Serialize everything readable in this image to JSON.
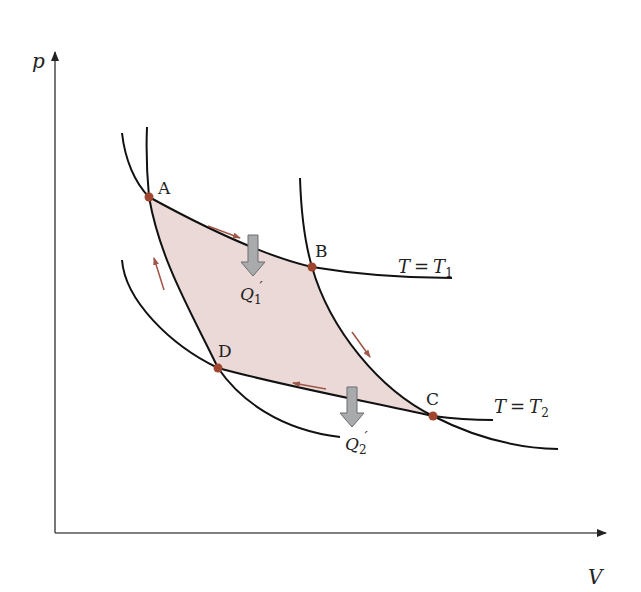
{
  "diagram": {
    "axes": {
      "y_label": "p",
      "x_label": "V"
    },
    "points": [
      {
        "label": "A",
        "x": 149,
        "y": 197
      },
      {
        "label": "B",
        "x": 312,
        "y": 267
      },
      {
        "label": "C",
        "x": 433,
        "y": 416
      },
      {
        "label": "D",
        "x": 218,
        "y": 368
      }
    ],
    "isotherms": [
      {
        "label_T": "T",
        "label_eq": "=",
        "label_sub_T": "T",
        "subscript": "1"
      },
      {
        "label_T": "T",
        "label_eq": "=",
        "label_sub_T": "T",
        "subscript": "2"
      }
    ],
    "heat_labels": [
      {
        "Q": "Q",
        "subscript": "1",
        "prime": "′"
      },
      {
        "Q": "Q",
        "subscript": "2",
        "prime": "′"
      }
    ],
    "colors": {
      "curve": "#111111",
      "axis": "#555555",
      "point": "#a0462e",
      "fill": "#ead9d6",
      "direction_arrow": "#a0574a",
      "heat_arrow_fill": "#a8aaac",
      "heat_arrow_stroke": "#6b6d70"
    }
  }
}
